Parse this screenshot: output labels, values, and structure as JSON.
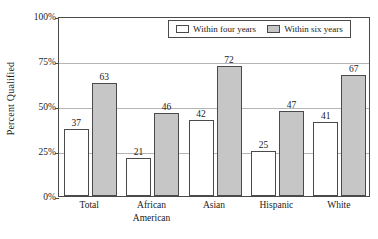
{
  "chart_data": {
    "type": "bar",
    "title": "",
    "xlabel": "",
    "ylabel": "Percent Qualified",
    "ylim": [
      0,
      100
    ],
    "y_ticks": [
      "0%",
      "25%",
      "50%",
      "75%",
      "100%"
    ],
    "y_tick_values": [
      0,
      25,
      50,
      75,
      100
    ],
    "grid": true,
    "legend_position": "top-right-inside",
    "categories": [
      "Total",
      "African American",
      "Asian",
      "Hispanic",
      "White"
    ],
    "category_lines": [
      [
        "Total",
        ""
      ],
      [
        "African",
        "American"
      ],
      [
        "Asian",
        ""
      ],
      [
        "Hispanic",
        ""
      ],
      [
        "White",
        ""
      ]
    ],
    "series": [
      {
        "name": "Within four years",
        "values": [
          37,
          21,
          42,
          25,
          41
        ],
        "color": "#ffffff",
        "edge_color": "#4a4a4a"
      },
      {
        "name": "Within six years",
        "values": [
          63,
          46,
          72,
          47,
          67
        ],
        "color": "#c6c6c6",
        "edge_color": "#4a4a4a"
      }
    ]
  },
  "legend": {
    "entries": [
      {
        "label": "Within four years",
        "swatch": "white-swatch"
      },
      {
        "label": "Within six years",
        "swatch": "gray-swatch"
      }
    ]
  },
  "colors": {
    "bar_four_years": "#ffffff",
    "bar_six_years": "#c6c6c6",
    "axis": "#4a4a4a",
    "gridline": "#b5b5b5",
    "text": "#1a1a1a",
    "background": "#ffffff"
  }
}
